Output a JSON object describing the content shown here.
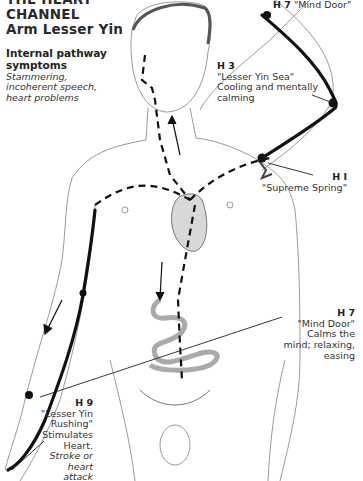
{
  "title": {
    "line0": "THE HEART",
    "line1": "CHANNEL",
    "line2": "Arm Lesser Yin"
  },
  "symptoms": {
    "heading_line1": "Internal pathway",
    "heading_line2": "symptoms",
    "text_line1": "Stammering,",
    "text_line2": "incoherent speech,",
    "text_line3": "heart problems"
  },
  "points": [
    {
      "code": "H 7",
      "name": "\"Mind Door\""
    },
    {
      "code": "H 3",
      "name": "\"Lesser Yin  Sea\"",
      "desc_line1": "Cooling and mentally",
      "desc_line2": "calming"
    },
    {
      "code": "H I",
      "name": "\"Supreme Spring\""
    },
    {
      "code": "H 7",
      "name": "\"Mind Door\"",
      "desc_line1": "Calms the",
      "desc_line2": "mind; relaxing,",
      "desc_line3": "easing"
    },
    {
      "code": "H 9",
      "name_line1": "\"Lesser Yin",
      "name_line2": "Rushing\"",
      "desc_line1": "Stimulates",
      "desc_line2": "Heart.",
      "italic_line1": "Stroke or",
      "italic_line2": "heart attack"
    }
  ],
  "colors": {
    "meridian": "#111111",
    "sketch": "#9a9a9a",
    "heart": "#cfcfcf"
  }
}
